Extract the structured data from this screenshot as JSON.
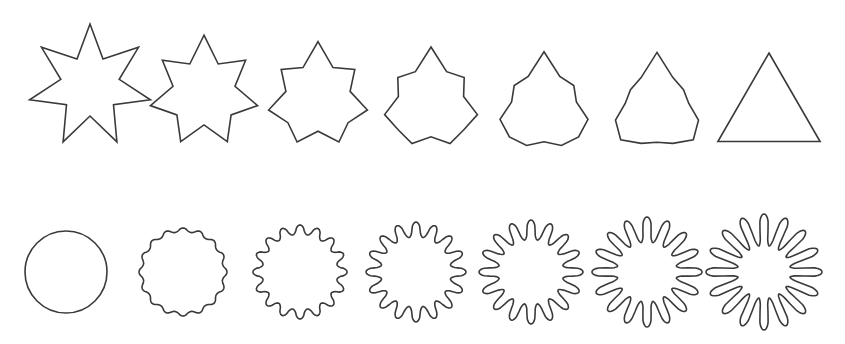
{
  "figure": {
    "background": "#ffffff",
    "stroke_color": "#3a3a3a",
    "rows": [
      {
        "name": "star-to-triangle-morph",
        "shapes": [
          {
            "kind": "star-morph",
            "cx": 90,
            "cy": 86,
            "points": 7,
            "outer": 62,
            "inner": 30,
            "t": 0.0
          },
          {
            "kind": "star-morph",
            "cx": 204,
            "cy": 92,
            "points": 7,
            "outer": 58,
            "inner": 32,
            "t": 0.17
          },
          {
            "kind": "star-morph",
            "cx": 318,
            "cy": 96,
            "points": 7,
            "outer": 56,
            "inner": 34,
            "t": 0.34
          },
          {
            "kind": "star-morph",
            "cx": 431,
            "cy": 100,
            "points": 7,
            "outer": 55,
            "inner": 36,
            "t": 0.5
          },
          {
            "kind": "star-morph",
            "cx": 544,
            "cy": 104,
            "points": 7,
            "outer": 55,
            "inner": 38,
            "t": 0.67
          },
          {
            "kind": "star-morph",
            "cx": 657,
            "cy": 104,
            "points": 7,
            "outer": 55,
            "inner": 42,
            "t": 0.84
          },
          {
            "kind": "triangle",
            "cx": 769,
            "cy": 112,
            "r": 59
          }
        ]
      },
      {
        "name": "circle-to-star-morph",
        "shapes": [
          {
            "kind": "circle",
            "cx": 66,
            "cy": 272,
            "r": 41
          },
          {
            "kind": "wavy-star",
            "cx": 183,
            "cy": 272,
            "points": 16,
            "outer": 44,
            "inner": 40
          },
          {
            "kind": "wavy-star",
            "cx": 300,
            "cy": 272,
            "points": 16,
            "outer": 47,
            "inner": 37
          },
          {
            "kind": "wavy-star",
            "cx": 416,
            "cy": 272,
            "points": 16,
            "outer": 50,
            "inner": 34
          },
          {
            "kind": "wavy-star",
            "cx": 531,
            "cy": 272,
            "points": 16,
            "outer": 52,
            "inner": 31
          },
          {
            "kind": "wavy-star",
            "cx": 647,
            "cy": 272,
            "points": 16,
            "outer": 55,
            "inner": 28
          },
          {
            "kind": "wavy-star",
            "cx": 764,
            "cy": 272,
            "points": 16,
            "outer": 58,
            "inner": 24
          }
        ]
      }
    ]
  }
}
